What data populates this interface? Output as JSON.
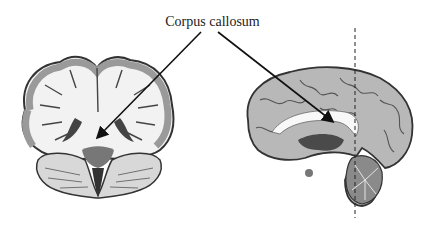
{
  "diagram": {
    "label": "Corpus callosum",
    "panels": [
      {
        "name": "coronal-section",
        "description": "Coronal brain slice with corpus callosum indicated"
      },
      {
        "name": "sagittal-section",
        "description": "Midsagittal brain section with corpus callosum indicated and dashed slice plane"
      }
    ],
    "arrows": [
      {
        "from": [
          201,
          32
        ],
        "to": [
          98,
          137
        ]
      },
      {
        "from": [
          218,
          32
        ],
        "to": [
          332,
          121
        ]
      }
    ],
    "slice_line": {
      "x": 355,
      "y1": 28,
      "y2": 218,
      "style": "dashed"
    },
    "colors": {
      "white_matter": "#f4f4f4",
      "gray_matter": "#a8a8a8",
      "dark": "#3a3a3a",
      "line": "#111111"
    }
  }
}
